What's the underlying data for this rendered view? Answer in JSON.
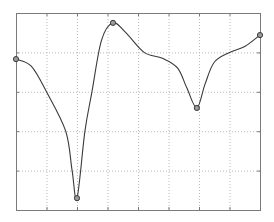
{
  "chart_data": {
    "type": "line",
    "title": "",
    "xlabel": "",
    "ylabel": "",
    "xlim": [
      0,
      8
    ],
    "ylim": [
      0,
      5
    ],
    "grid": true,
    "grid_style": "dotted",
    "legend": null,
    "tick_labels_visible": false,
    "x_ticks": [
      0,
      1,
      2,
      3,
      4,
      5,
      6,
      7,
      8
    ],
    "y_ticks": [
      0,
      1,
      2,
      3,
      4,
      5
    ],
    "series": [
      {
        "name": "",
        "interpolation": "smooth spline",
        "marker": "circle",
        "color": "#333333",
        "points": [
          {
            "x": 0.0,
            "y": 3.83
          },
          {
            "x": 2.0,
            "y": 0.3
          },
          {
            "x": 3.18,
            "y": 4.75
          },
          {
            "x": 5.93,
            "y": 2.59
          },
          {
            "x": 8.0,
            "y": 4.44
          }
        ],
        "curve_guide_points": [
          {
            "x": 0.0,
            "y": 3.83
          },
          {
            "x": 0.5,
            "y": 3.65
          },
          {
            "x": 1.0,
            "y": 3.0
          },
          {
            "x": 1.63,
            "y": 2.0
          },
          {
            "x": 1.84,
            "y": 1.0
          },
          {
            "x": 2.0,
            "y": 0.3
          },
          {
            "x": 2.26,
            "y": 2.0
          },
          {
            "x": 2.49,
            "y": 3.0
          },
          {
            "x": 2.8,
            "y": 4.3
          },
          {
            "x": 3.18,
            "y": 4.75
          },
          {
            "x": 3.6,
            "y": 4.5
          },
          {
            "x": 4.2,
            "y": 4.0
          },
          {
            "x": 4.8,
            "y": 3.85
          },
          {
            "x": 5.3,
            "y": 3.6
          },
          {
            "x": 5.6,
            "y": 3.1
          },
          {
            "x": 5.93,
            "y": 2.59
          },
          {
            "x": 6.2,
            "y": 3.2
          },
          {
            "x": 6.5,
            "y": 3.75
          },
          {
            "x": 7.0,
            "y": 4.0
          },
          {
            "x": 7.5,
            "y": 4.15
          },
          {
            "x": 8.0,
            "y": 4.44
          }
        ]
      }
    ]
  },
  "style": {
    "axes_color": "#7a7a7a",
    "grid_color": "#b8b8b8",
    "line_color": "#3a3a3a",
    "marker_fill": "#9a9a9a",
    "background": "#ffffff"
  },
  "layout": {
    "plot_left": 16,
    "plot_top": 13,
    "plot_right": 260,
    "plot_bottom": 210
  }
}
